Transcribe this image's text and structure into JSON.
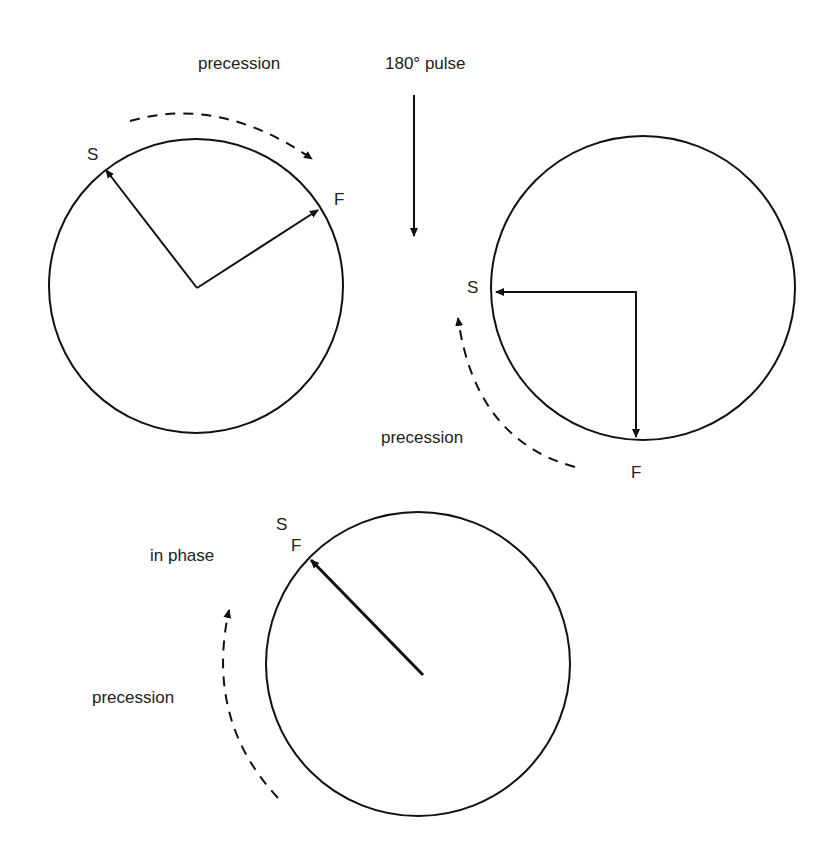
{
  "diagram": {
    "pulse_label": "180° pulse",
    "panels": [
      {
        "id": "before-pulse",
        "precession_label": "precession",
        "slow_label": "S",
        "fast_label": "F"
      },
      {
        "id": "after-pulse",
        "precession_label": "precession",
        "slow_label": "S",
        "fast_label": "F"
      },
      {
        "id": "refocused",
        "precession_label": "precession",
        "phase_label": "in phase",
        "slow_label": "S",
        "fast_label": "F"
      }
    ]
  }
}
